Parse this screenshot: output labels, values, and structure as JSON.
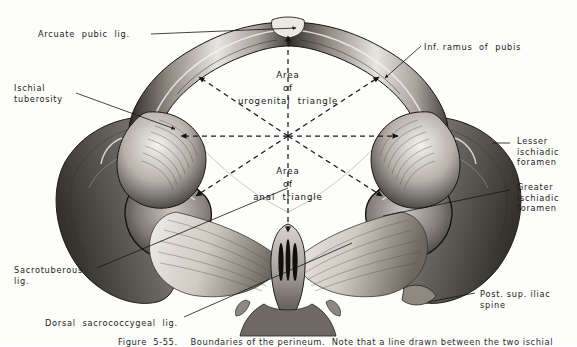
{
  "figure": {
    "title": "Boundaries of the perineum",
    "view": "Inferior view of the bony pelvis with ligaments",
    "caption": "Figure  5-55.    Boundaries of the perineum.  Note that a line drawn between the two ischial",
    "background_color": "#ffffff",
    "ink_color": "#141414"
  },
  "labels": [
    {
      "id": "arcuate-pubic-lig",
      "text": "Arcuate  pubic  lig.",
      "align": "left",
      "x": 38,
      "y": 29,
      "leader": [
        [
          151,
          34
        ],
        [
          296,
          28
        ]
      ]
    },
    {
      "id": "ischial-tuberosity",
      "text": "Ischial\ntuberosity",
      "align": "left",
      "x": 14,
      "y": 83,
      "leader": [
        [
          76,
          93
        ],
        [
          175,
          129
        ]
      ]
    },
    {
      "id": "inf-ramus-of-pubis",
      "text": "Inf. ramus  of  pubis",
      "align": "left",
      "x": 424,
      "y": 42,
      "leader": [
        [
          421,
          46
        ],
        [
          385,
          78
        ]
      ]
    },
    {
      "id": "lesser-ischiadic-foramen",
      "text": "Lesser\nischiadic\nforamen",
      "align": "left",
      "x": 513,
      "y": 136,
      "leader": [
        [
          510,
          143
        ],
        [
          495,
          143
        ]
      ]
    },
    {
      "id": "greater-ischiadic-foramen",
      "text": "Greater\nischiadic\nforamen",
      "align": "left",
      "x": 513,
      "y": 182,
      "leader": [
        [
          510,
          190
        ],
        [
          383,
          216
        ]
      ]
    },
    {
      "id": "sacrotuberous-lig",
      "text": "Sacrotuberous\nlig.",
      "align": "left",
      "x": 14,
      "y": 265,
      "leader": [
        [
          97,
          268
        ],
        [
          288,
          188
        ]
      ]
    },
    {
      "id": "dorsal-sacrococcygeal-lig",
      "text": "Dorsal  sacrococcygeal  lig.",
      "align": "left",
      "x": 45,
      "y": 318,
      "leader": [
        [
          184,
          317
        ],
        [
          352,
          243
        ]
      ]
    },
    {
      "id": "post-sup-iliac-spine",
      "text": "Post. sup. iliac\nspine",
      "align": "left",
      "x": 478,
      "y": 289,
      "leader": [
        [
          475,
          293
        ],
        [
          428,
          302
        ]
      ]
    }
  ],
  "area_labels": [
    {
      "id": "area-urogenital-triangle",
      "text": "Area\nof\nurogenital  triangle",
      "x": 288,
      "y": 69
    },
    {
      "id": "area-anal-triangle",
      "text": "Area\nof\nanal  triangle",
      "x": 288,
      "y": 165
    }
  ],
  "diagram": {
    "center": [
      288,
      136
    ],
    "rays": [
      {
        "id": "ray-up",
        "to": [
          288,
          36
        ],
        "arrow": true
      },
      {
        "id": "ray-down",
        "to": [
          288,
          232
        ],
        "arrow": true
      },
      {
        "id": "ray-left",
        "to": [
          181,
          136
        ],
        "arrow": true
      },
      {
        "id": "ray-right",
        "to": [
          398,
          136
        ],
        "arrow": true
      },
      {
        "id": "ray-upper-left",
        "to": [
          199,
          77
        ],
        "arrow": true
      },
      {
        "id": "ray-upper-right",
        "to": [
          379,
          77
        ],
        "arrow": true
      },
      {
        "id": "ray-lower-left",
        "to": [
          196,
          196
        ],
        "arrow": true
      },
      {
        "id": "ray-lower-right",
        "to": [
          382,
          196
        ],
        "arrow": true
      }
    ]
  }
}
